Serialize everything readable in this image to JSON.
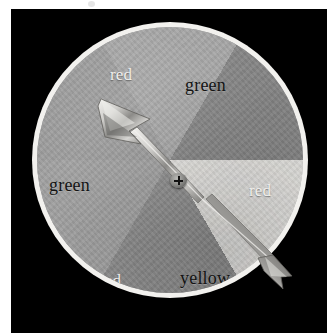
{
  "figure": {
    "kind": "spinner-wheel-photograph",
    "background_color": "#ffffff",
    "panel_color": "#000000",
    "rim_color": "#f2f1ee"
  },
  "spinner": {
    "pointer": {
      "name": "arrow-needle",
      "direction_degrees": 296,
      "points_toward_label": "red",
      "pivot_marker": "plus-cross"
    },
    "sectors": [
      {
        "label": "red",
        "position": "top-left",
        "fill": "#9d9d9d",
        "text_color": "#f0efec",
        "start_deg": -90,
        "end_deg": -30
      },
      {
        "label": "green",
        "position": "top-right",
        "fill": "#a7a7a7",
        "text_color": "#131313",
        "start_deg": -30,
        "end_deg": 30
      },
      {
        "label": "red",
        "position": "right",
        "fill": "#868686",
        "text_color": "#f0efec",
        "start_deg": 30,
        "end_deg": 90
      },
      {
        "label": "yellow",
        "position": "bottom-right",
        "fill": "#e6e5e2",
        "text_color": "#131313",
        "start_deg": 90,
        "end_deg": 150
      },
      {
        "label": "red",
        "position": "bottom-left",
        "fill": "#8f8f8f",
        "text_color": "#f0efec",
        "start_deg": 150,
        "end_deg": 210
      },
      {
        "label": "green",
        "position": "left",
        "fill": "#a2a2a2",
        "text_color": "#131313",
        "start_deg": 210,
        "end_deg": 270
      }
    ],
    "labels": {
      "top_left": "red",
      "top_right": "green",
      "right": "red",
      "bottom_right": "yellow",
      "bottom_left": "red",
      "left": "green"
    }
  }
}
